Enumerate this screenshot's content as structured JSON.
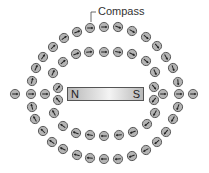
{
  "diagram": {
    "label": "Compass",
    "magnet": {
      "north": "N",
      "south": "S"
    },
    "colors": {
      "compass_fill": "#b4b4b4",
      "compass_stroke": "#444444",
      "needle": "#222222"
    },
    "compasses": [
      {
        "x": 90,
        "y": 28,
        "a": 180
      },
      {
        "x": 104,
        "y": 27,
        "a": 180
      },
      {
        "x": 118,
        "y": 27,
        "a": 200
      },
      {
        "x": 132,
        "y": 31,
        "a": 210
      },
      {
        "x": 146,
        "y": 37,
        "a": 220
      },
      {
        "x": 157,
        "y": 46,
        "a": 230
      },
      {
        "x": 166,
        "y": 57,
        "a": 240
      },
      {
        "x": 173,
        "y": 68,
        "a": 250
      },
      {
        "x": 178,
        "y": 82,
        "a": 265
      },
      {
        "x": 179,
        "y": 94,
        "a": 180
      },
      {
        "x": 178,
        "y": 107,
        "a": 290
      },
      {
        "x": 173,
        "y": 119,
        "a": 300
      },
      {
        "x": 166,
        "y": 132,
        "a": 310
      },
      {
        "x": 157,
        "y": 142,
        "a": 320
      },
      {
        "x": 146,
        "y": 150,
        "a": 330
      },
      {
        "x": 132,
        "y": 156,
        "a": 340
      },
      {
        "x": 118,
        "y": 159,
        "a": 355
      },
      {
        "x": 104,
        "y": 159,
        "a": 0
      },
      {
        "x": 90,
        "y": 158,
        "a": 5
      },
      {
        "x": 77,
        "y": 155,
        "a": 15
      },
      {
        "x": 63,
        "y": 149,
        "a": 25
      },
      {
        "x": 52,
        "y": 142,
        "a": 35
      },
      {
        "x": 43,
        "y": 131,
        "a": 45
      },
      {
        "x": 35,
        "y": 119,
        "a": 60
      },
      {
        "x": 32,
        "y": 107,
        "a": 75
      },
      {
        "x": 31,
        "y": 94,
        "a": 180
      },
      {
        "x": 32,
        "y": 81,
        "a": 105
      },
      {
        "x": 36,
        "y": 68,
        "a": 115
      },
      {
        "x": 43,
        "y": 57,
        "a": 125
      },
      {
        "x": 53,
        "y": 47,
        "a": 135
      },
      {
        "x": 64,
        "y": 38,
        "a": 145
      },
      {
        "x": 77,
        "y": 32,
        "a": 160
      },
      {
        "x": 63,
        "y": 62,
        "a": 140
      },
      {
        "x": 76,
        "y": 54,
        "a": 160
      },
      {
        "x": 89,
        "y": 52,
        "a": 175
      },
      {
        "x": 104,
        "y": 52,
        "a": 180
      },
      {
        "x": 118,
        "y": 52,
        "a": 190
      },
      {
        "x": 132,
        "y": 54,
        "a": 205
      },
      {
        "x": 146,
        "y": 61,
        "a": 220
      },
      {
        "x": 155,
        "y": 72,
        "a": 245
      },
      {
        "x": 154,
        "y": 87,
        "a": 230
      },
      {
        "x": 154,
        "y": 100,
        "a": 310
      },
      {
        "x": 155,
        "y": 113,
        "a": 300
      },
      {
        "x": 147,
        "y": 124,
        "a": 320
      },
      {
        "x": 133,
        "y": 132,
        "a": 340
      },
      {
        "x": 119,
        "y": 135,
        "a": 355
      },
      {
        "x": 104,
        "y": 136,
        "a": 0
      },
      {
        "x": 90,
        "y": 135,
        "a": 10
      },
      {
        "x": 76,
        "y": 133,
        "a": 20
      },
      {
        "x": 63,
        "y": 126,
        "a": 35
      },
      {
        "x": 54,
        "y": 113,
        "a": 60
      },
      {
        "x": 58,
        "y": 100,
        "a": 50
      },
      {
        "x": 58,
        "y": 88,
        "a": 130
      },
      {
        "x": 53,
        "y": 73,
        "a": 115
      },
      {
        "x": 15,
        "y": 94,
        "a": 180
      },
      {
        "x": 45,
        "y": 94,
        "a": 180
      },
      {
        "x": 163,
        "y": 94,
        "a": 180
      },
      {
        "x": 193,
        "y": 94,
        "a": 180
      }
    ]
  }
}
